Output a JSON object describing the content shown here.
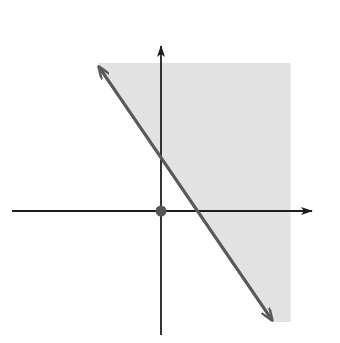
{
  "chart_data": {
    "type": "line",
    "title": "",
    "xlabel": "x",
    "ylabel": "y",
    "xlim": [
      -7,
      7
    ],
    "ylim": [
      -6,
      8
    ],
    "grid": true,
    "grid_style": "dotted, 1-unit spacing",
    "boundary_line": {
      "equation": "3x + 2y = 6",
      "style": "solid",
      "x_intercept": 2,
      "y_intercept": 3,
      "endpoints": [
        [
          -3.4,
          8
        ],
        [
          6,
          -6
        ]
      ]
    },
    "shaded_region": {
      "inequality": "3x + 2y ≥ 6",
      "side": "upper-right of line"
    },
    "test_point": {
      "label": "(0, 0)",
      "x": 0,
      "y": 0
    },
    "annotations": [
      {
        "text": "3x + 2y = 6",
        "role": "line label"
      },
      {
        "text": "3x + 2y ≥ 6",
        "role": "region label"
      },
      {
        "text": "3",
        "role": "y-intercept tick"
      },
      {
        "text": "2",
        "role": "x-intercept tick"
      },
      {
        "text": "0",
        "role": "origin label"
      },
      {
        "text": "(0, 0)",
        "role": "test point label"
      }
    ]
  },
  "labels": {
    "x_axis": "x",
    "y_axis": "y",
    "line_eq": "3x + 2y = 6",
    "region_ineq": "3x + 2y ≥ 6",
    "test_point": "(0, 0)",
    "origin": "0",
    "y_int": "3",
    "x_int": "2"
  },
  "colors": {
    "shade": "#e2e2e2",
    "line": "#5a5a5a",
    "axis": "#2a2a2a",
    "grid": "#9a9a9a",
    "point": "#555555"
  }
}
